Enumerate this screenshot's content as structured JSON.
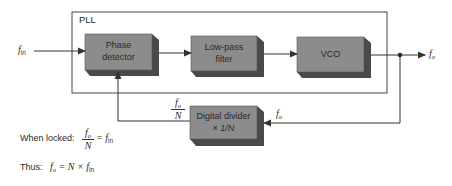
{
  "diagram": {
    "title": "PLL",
    "blocks": [
      {
        "id": "phase-detector",
        "line1": "Phase",
        "line2": "detector"
      },
      {
        "id": "low-pass-filter",
        "line1": "Low-pass",
        "line2": "filter"
      },
      {
        "id": "vco",
        "line1": "VCO",
        "line2": ""
      },
      {
        "id": "digital-divider",
        "line1": "Digital divider",
        "line2": "× 1/N"
      }
    ],
    "signals": {
      "input": {
        "main": "f",
        "sub": "in"
      },
      "output": {
        "main": "f",
        "sub": "o"
      },
      "feedback_in": {
        "main": "f",
        "sub": "o"
      },
      "divided": {
        "num_main": "f",
        "num_sub": "o",
        "den": "N"
      }
    },
    "colors": {
      "block_face": "#8c8c8c",
      "block_shadow": "#4a4a4a",
      "line": "#333333"
    }
  },
  "equations": {
    "locked_label": "When locked:",
    "locked_num": "f",
    "locked_num_sub": "o",
    "locked_den": "N",
    "locked_rhs": "= f",
    "locked_rhs_sub": "in",
    "thus_label": "Thus:",
    "thus_lhs": "f",
    "thus_lhs_sub": "o",
    "thus_rhs": "= N × f",
    "thus_rhs_sub": "in"
  }
}
